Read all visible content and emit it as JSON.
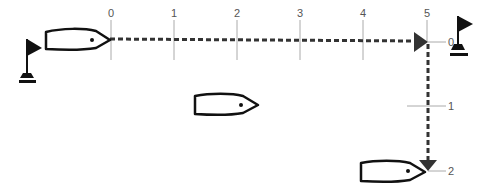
{
  "diagram": {
    "type": "sailing-race-start-diagram",
    "colors": {
      "line": "#333333",
      "tick": "#999999",
      "label": "#555555",
      "boat_outline": "#111111",
      "flag": "#111111"
    },
    "horizontal_axis": {
      "labels": [
        "0",
        "1",
        "2",
        "3",
        "4",
        "5"
      ],
      "x_positions": [
        111,
        174,
        237,
        300,
        363,
        426
      ]
    },
    "vertical_axis": {
      "labels": [
        "0",
        "1",
        "2"
      ],
      "y_positions": [
        42,
        105,
        170
      ]
    },
    "boats": [
      {
        "name": "boat-start-left"
      },
      {
        "name": "boat-middle"
      },
      {
        "name": "boat-bottom-right"
      }
    ],
    "marks": [
      {
        "name": "flag-mark-left"
      },
      {
        "name": "flag-mark-right"
      }
    ],
    "paths": [
      {
        "name": "dashed-path-horizontal",
        "from": "0",
        "to": "5"
      },
      {
        "name": "dashed-path-vertical",
        "from": "0",
        "to": "2"
      }
    ]
  }
}
